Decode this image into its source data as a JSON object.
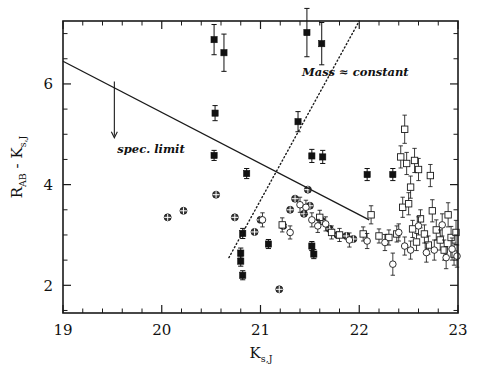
{
  "figure": {
    "background": "#ffffff",
    "ink_color": "#111111"
  },
  "chart_data": {
    "type": "scatter",
    "title": "",
    "subtitle": "",
    "xlabel": "K_s,J",
    "xlabel_base": "K",
    "xlabel_sub": "s,J",
    "ylabel": "R_AB - K_s,J",
    "ylabel_parts": {
      "first_base": "R",
      "first_sub": "AB",
      "operator": "-",
      "second_base": "K",
      "second_sub": "s,J"
    },
    "xlim": [
      19,
      23
    ],
    "ylim": [
      1.45,
      7.25
    ],
    "x_major_ticks": [
      19,
      20,
      21,
      22,
      23
    ],
    "x_major_tick_labels": [
      "19",
      "20",
      "21",
      "22",
      "23"
    ],
    "x_minor_tick_step": 0.2,
    "y_major_ticks": [
      2,
      4,
      6
    ],
    "y_major_tick_labels": [
      "2",
      "4",
      "6"
    ],
    "y_minor_tick_step": 0.5,
    "grid": false,
    "legend_position": "none",
    "annotations": [
      {
        "id": "spec-limit",
        "text": "spec. limit",
        "x": 19.55,
        "y": 4.62,
        "style": "bold-italic"
      },
      {
        "id": "mass-constant",
        "text": "Mass ≈ constant",
        "x": 21.42,
        "y": 6.15,
        "style": "bold-italic"
      }
    ],
    "arrows": [
      {
        "id": "spec-limit-arrow",
        "x": 19.52,
        "y_start": 6.05,
        "y_end": 4.95,
        "direction": "down"
      }
    ],
    "lines": [
      {
        "id": "selection-limit-line",
        "style": "solid",
        "x": [
          19.0,
          22.1
        ],
        "y": [
          6.45,
          3.3
        ]
      },
      {
        "id": "constant-mass-line",
        "style": "dotted",
        "x": [
          20.68,
          22.0
        ],
        "y": [
          2.55,
          7.25
        ]
      }
    ],
    "series": [
      {
        "name": "filled-square",
        "marker": "filled-square",
        "color": "#111111",
        "points": [
          {
            "x": 20.53,
            "y": 6.88,
            "yerr": 0.3
          },
          {
            "x": 20.63,
            "y": 6.62,
            "yerr": 0.37
          },
          {
            "x": 21.47,
            "y": 7.02,
            "yerr": 0.48
          },
          {
            "x": 21.62,
            "y": 6.8,
            "yerr": 0.42
          },
          {
            "x": 20.54,
            "y": 5.42,
            "yerr": 0.15
          },
          {
            "x": 21.38,
            "y": 5.25,
            "yerr": 0.2
          },
          {
            "x": 20.53,
            "y": 4.58,
            "yerr": 0.1
          },
          {
            "x": 21.52,
            "y": 4.57,
            "yerr": 0.13
          },
          {
            "x": 21.63,
            "y": 4.55,
            "yerr": 0.13
          },
          {
            "x": 20.86,
            "y": 4.22,
            "yerr": 0.1
          },
          {
            "x": 22.08,
            "y": 4.2,
            "yerr": 0.12
          },
          {
            "x": 22.34,
            "y": 4.2,
            "yerr": 0.12
          },
          {
            "x": 20.82,
            "y": 3.03,
            "yerr": 0.1
          },
          {
            "x": 20.8,
            "y": 2.64,
            "yerr": 0.1
          },
          {
            "x": 20.8,
            "y": 2.48,
            "yerr": 0.1
          },
          {
            "x": 20.82,
            "y": 2.2,
            "yerr": 0.09
          },
          {
            "x": 21.52,
            "y": 2.78,
            "yerr": 0.09
          },
          {
            "x": 21.54,
            "y": 2.62,
            "yerr": 0.09
          },
          {
            "x": 21.08,
            "y": 2.82,
            "yerr": 0.09
          }
        ]
      },
      {
        "name": "crossed-circle",
        "marker": "crossed-circle",
        "color": "#1a1a1a",
        "points": [
          {
            "x": 20.06,
            "y": 3.35,
            "yerr": 0
          },
          {
            "x": 20.22,
            "y": 3.48,
            "yerr": 0
          },
          {
            "x": 20.55,
            "y": 3.8,
            "yerr": 0
          },
          {
            "x": 20.74,
            "y": 3.35,
            "yerr": 0
          },
          {
            "x": 21.19,
            "y": 1.92,
            "yerr": 0
          },
          {
            "x": 20.94,
            "y": 3.06,
            "yerr": 0
          },
          {
            "x": 21.0,
            "y": 3.3,
            "yerr": 0
          },
          {
            "x": 21.23,
            "y": 3.18,
            "yerr": 0
          },
          {
            "x": 21.3,
            "y": 3.5,
            "yerr": 0
          },
          {
            "x": 21.44,
            "y": 3.42,
            "yerr": 0
          },
          {
            "x": 21.5,
            "y": 3.58,
            "yerr": 0
          },
          {
            "x": 21.62,
            "y": 3.28,
            "yerr": 0
          },
          {
            "x": 21.7,
            "y": 3.12,
            "yerr": 0
          },
          {
            "x": 21.78,
            "y": 3.0,
            "yerr": 0
          },
          {
            "x": 21.87,
            "y": 2.98,
            "yerr": 0
          },
          {
            "x": 21.94,
            "y": 2.92,
            "yerr": 0
          },
          {
            "x": 21.48,
            "y": 3.9,
            "yerr": 0
          },
          {
            "x": 21.35,
            "y": 3.72,
            "yerr": 0
          }
        ]
      },
      {
        "name": "open-square",
        "marker": "open-square",
        "color": "#1a1a1a",
        "points": [
          {
            "x": 22.46,
            "y": 5.1,
            "yerr": 0.28
          },
          {
            "x": 22.6,
            "y": 4.3,
            "yerr": 0.22
          },
          {
            "x": 21.22,
            "y": 3.2,
            "yerr": 0.14
          },
          {
            "x": 21.6,
            "y": 3.35,
            "yerr": 0.14
          },
          {
            "x": 21.72,
            "y": 3.05,
            "yerr": 0.13
          },
          {
            "x": 21.8,
            "y": 3.0,
            "yerr": 0.13
          },
          {
            "x": 22.04,
            "y": 3.02,
            "yerr": 0.14
          },
          {
            "x": 22.12,
            "y": 3.4,
            "yerr": 0.18
          },
          {
            "x": 22.2,
            "y": 2.98,
            "yerr": 0.14
          },
          {
            "x": 22.3,
            "y": 2.95,
            "yerr": 0.15
          },
          {
            "x": 22.38,
            "y": 3.02,
            "yerr": 0.16
          },
          {
            "x": 22.44,
            "y": 3.55,
            "yerr": 0.2
          },
          {
            "x": 22.5,
            "y": 3.62,
            "yerr": 0.22
          },
          {
            "x": 22.52,
            "y": 3.95,
            "yerr": 0.22
          },
          {
            "x": 22.54,
            "y": 3.12,
            "yerr": 0.17
          },
          {
            "x": 22.58,
            "y": 2.86,
            "yerr": 0.17
          },
          {
            "x": 22.62,
            "y": 3.32,
            "yerr": 0.18
          },
          {
            "x": 22.66,
            "y": 3.02,
            "yerr": 0.18
          },
          {
            "x": 22.7,
            "y": 2.8,
            "yerr": 0.18
          },
          {
            "x": 22.74,
            "y": 3.48,
            "yerr": 0.22
          },
          {
            "x": 22.78,
            "y": 3.1,
            "yerr": 0.2
          },
          {
            "x": 22.82,
            "y": 2.9,
            "yerr": 0.2
          },
          {
            "x": 22.86,
            "y": 2.7,
            "yerr": 0.2
          },
          {
            "x": 22.9,
            "y": 3.4,
            "yerr": 0.24
          },
          {
            "x": 22.93,
            "y": 2.95,
            "yerr": 0.22
          },
          {
            "x": 22.96,
            "y": 2.62,
            "yerr": 0.22
          },
          {
            "x": 22.98,
            "y": 3.05,
            "yerr": 0.24
          },
          {
            "x": 22.72,
            "y": 4.18,
            "yerr": 0.22
          },
          {
            "x": 22.42,
            "y": 4.55,
            "yerr": 0.22
          },
          {
            "x": 22.48,
            "y": 4.42,
            "yerr": 0.22
          },
          {
            "x": 22.56,
            "y": 4.48,
            "yerr": 0.24
          }
        ]
      },
      {
        "name": "open-circle",
        "marker": "open-circle",
        "color": "#1a1a1a",
        "points": [
          {
            "x": 21.4,
            "y": 3.6,
            "yerr": 0.15
          },
          {
            "x": 21.46,
            "y": 3.55,
            "yerr": 0.14
          },
          {
            "x": 21.52,
            "y": 3.3,
            "yerr": 0.14
          },
          {
            "x": 21.58,
            "y": 3.18,
            "yerr": 0.13
          },
          {
            "x": 21.66,
            "y": 3.22,
            "yerr": 0.14
          },
          {
            "x": 21.9,
            "y": 2.9,
            "yerr": 0.14
          },
          {
            "x": 22.08,
            "y": 2.88,
            "yerr": 0.15
          },
          {
            "x": 22.26,
            "y": 2.85,
            "yerr": 0.16
          },
          {
            "x": 22.34,
            "y": 2.42,
            "yerr": 0.22
          },
          {
            "x": 22.4,
            "y": 3.05,
            "yerr": 0.17
          },
          {
            "x": 22.46,
            "y": 2.78,
            "yerr": 0.18
          },
          {
            "x": 22.52,
            "y": 2.7,
            "yerr": 0.18
          },
          {
            "x": 22.6,
            "y": 3.18,
            "yerr": 0.18
          },
          {
            "x": 22.68,
            "y": 2.65,
            "yerr": 0.19
          },
          {
            "x": 22.76,
            "y": 2.7,
            "yerr": 0.2
          },
          {
            "x": 22.84,
            "y": 3.2,
            "yerr": 0.22
          },
          {
            "x": 22.88,
            "y": 2.55,
            "yerr": 0.22
          },
          {
            "x": 22.94,
            "y": 2.72,
            "yerr": 0.22
          },
          {
            "x": 22.99,
            "y": 2.58,
            "yerr": 0.22
          },
          {
            "x": 21.02,
            "y": 3.3,
            "yerr": 0.14
          },
          {
            "x": 21.3,
            "y": 3.05,
            "yerr": 0.13
          }
        ]
      }
    ]
  }
}
